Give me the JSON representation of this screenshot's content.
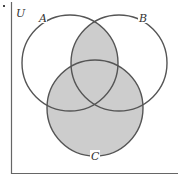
{
  "diagram": {
    "type": "venn",
    "universe_label": "U",
    "sets": [
      {
        "name": "A",
        "label": "A"
      },
      {
        "name": "B",
        "label": "B"
      },
      {
        "name": "C",
        "label": "C"
      }
    ],
    "shaded_region": "(A ∩ B) ∪ C",
    "colors": {
      "shade": "#cdcdcd",
      "stroke": "#555555",
      "background": "#ffffff"
    }
  }
}
